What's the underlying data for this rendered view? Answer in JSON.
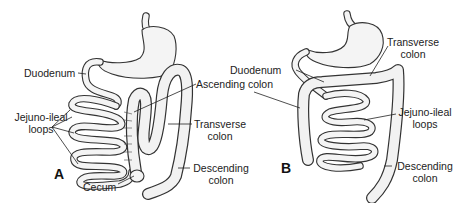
{
  "figure": {
    "panel_a": {
      "letter": "A",
      "labels": {
        "duodenum": "Duodenum",
        "jejuno_ileal_1": "Jejuno-ileal",
        "jejuno_ileal_2": "loops",
        "cecum": "Cecum",
        "ascending_colon": "Ascending colon",
        "transverse_1": "Transverse",
        "transverse_2": "colon",
        "descending_1": "Descending",
        "descending_2": "colon"
      }
    },
    "panel_b": {
      "letter": "B",
      "labels": {
        "duodenum": "Duodenum",
        "transverse_1": "Transverse",
        "transverse_2": "colon",
        "jejuno_ileal_1": "Jejuno-ileal",
        "jejuno_ileal_2": "loops",
        "descending_1": "Descending",
        "descending_2": "colon"
      }
    }
  }
}
